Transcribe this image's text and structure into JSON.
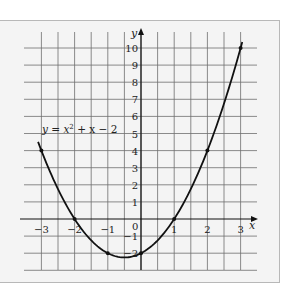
{
  "chart_data": {
    "type": "line",
    "title": "",
    "equation_label": "y = x² + x − 2",
    "equation_parts": {
      "lhs": "y",
      "eq": " = ",
      "x": "x",
      "sup": "2",
      "rest": " + x − 2"
    },
    "xlabel": "x",
    "ylabel": "y",
    "xlim": [
      -3,
      3
    ],
    "ylim": [
      -3,
      10.5
    ],
    "grid": true,
    "grid_step_x": 0.5,
    "grid_step_y": 1,
    "x_ticks": [
      -3,
      -2,
      -1,
      1,
      2,
      3
    ],
    "x_tick_labels": [
      "−3",
      "−2",
      "−1",
      "1",
      "2",
      "3"
    ],
    "y_ticks": [
      10,
      9,
      8,
      7,
      6,
      5,
      4,
      3,
      2,
      1,
      -1,
      -2
    ],
    "y_tick_labels": [
      "10",
      "9",
      "8",
      "7",
      "6",
      "5",
      "4",
      "3",
      "2",
      "1",
      "−1",
      "−2"
    ],
    "origin_label": "0",
    "series": [
      {
        "name": "y = x² + x − 2",
        "function": "x^2 + x - 2",
        "x_range": [
          -3.1,
          3.05
        ],
        "points": [
          {
            "x": -3,
            "y": 4
          },
          {
            "x": -2,
            "y": 0
          },
          {
            "x": -1,
            "y": -2
          },
          {
            "x": 0,
            "y": -2
          },
          {
            "x": 1,
            "y": 0
          },
          {
            "x": 2,
            "y": 4
          },
          {
            "x": 3,
            "y": 10
          }
        ]
      }
    ],
    "colors": {
      "grid": "#6e6e6e",
      "axis": "#111111",
      "curve": "#111111",
      "background": "#f4f4f4"
    }
  }
}
